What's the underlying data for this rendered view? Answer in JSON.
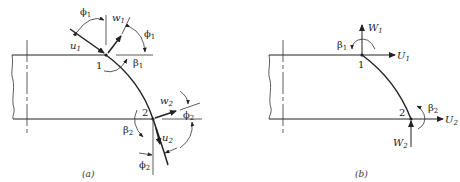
{
  "figure": {
    "panel_a": {
      "caption": "(a)",
      "labels": {
        "phi1_top": {
          "base": "ϕ",
          "sub": "1"
        },
        "w1": {
          "base": "w",
          "sub": "1"
        },
        "phi1_right": {
          "base": "ϕ",
          "sub": "1"
        },
        "u1": {
          "base": "u",
          "sub": "1"
        },
        "node1": "1",
        "beta1": {
          "base": "β",
          "sub": "1"
        },
        "w2": {
          "base": "w",
          "sub": "2"
        },
        "phi2_right": {
          "base": "ϕ",
          "sub": "2"
        },
        "node2": "2",
        "beta2": {
          "base": "β",
          "sub": "2"
        },
        "u2": {
          "base": "u",
          "sub": "2"
        },
        "phi2_bottom": {
          "base": "ϕ",
          "sub": "2"
        }
      }
    },
    "panel_b": {
      "caption": "(b)",
      "labels": {
        "W1": {
          "base": "W",
          "sub": "1"
        },
        "beta1": {
          "base": "β",
          "sub": "1"
        },
        "U1": {
          "base": "U",
          "sub": "1"
        },
        "node1": "1",
        "node2": "2",
        "beta2": {
          "base": "β",
          "sub": "2"
        },
        "U2": {
          "base": "U",
          "sub": "2"
        },
        "W2": {
          "base": "W",
          "sub": "2"
        }
      }
    }
  }
}
